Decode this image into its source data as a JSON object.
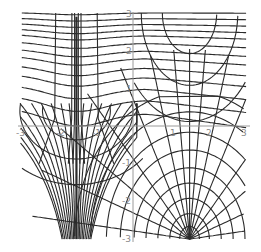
{
  "chart_data": {
    "type": "line",
    "title": "",
    "xlabel": "",
    "ylabel": "",
    "xlim": [
      -3,
      3
    ],
    "ylim": [
      -3,
      3
    ],
    "grid": false,
    "legend": null,
    "x_ticks": [
      "-3",
      "-2",
      "-1",
      "1",
      "2",
      "3"
    ],
    "y_ticks": [
      "3",
      "2",
      "1",
      "-1",
      "-2",
      "-3"
    ],
    "singular_lines_x": [
      -1.5,
      1.5
    ],
    "series": [
      {
        "name": "horizontal family (upper region)",
        "y_levels": [
          3.0,
          2.85,
          2.7,
          2.55,
          2.4,
          2.2,
          2.0,
          1.8,
          1.55,
          1.3,
          1.0,
          0.7,
          0.35
        ]
      },
      {
        "name": "fan family converging at (1.5, -3)",
        "radii": [
          0.25,
          0.5,
          0.8,
          1.1,
          1.4,
          1.75,
          2.1,
          2.5,
          2.9
        ]
      },
      {
        "name": "cusp family at x=-1.5",
        "levels": [
          0.2,
          0.45,
          0.75,
          1.05,
          1.35,
          1.7,
          2.05,
          2.4,
          2.75,
          3.0
        ]
      }
    ]
  },
  "axes": {
    "x_tick_labels": [
      {
        "label": "-3",
        "value": -3
      },
      {
        "label": "-2",
        "value": -2
      },
      {
        "label": "-1",
        "value": -1
      },
      {
        "label": "1",
        "value": 1
      },
      {
        "label": "2",
        "value": 2
      },
      {
        "label": "3",
        "value": 3
      }
    ],
    "y_tick_labels": [
      {
        "label": "3",
        "value": 3
      },
      {
        "label": "2",
        "value": 2
      },
      {
        "label": "1",
        "value": 1
      },
      {
        "label": "-1",
        "value": -1
      },
      {
        "label": "-2",
        "value": -2
      },
      {
        "label": "-3",
        "value": -3
      }
    ]
  },
  "colors": {
    "curve": "#2b2b2b",
    "axis": "#9a9a9a",
    "tick_text": "#8a8a8a",
    "background": "#ffffff"
  }
}
